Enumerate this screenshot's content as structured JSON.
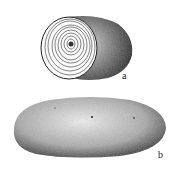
{
  "figure": {
    "panels": [
      {
        "id": "a",
        "label": "a",
        "description": "cut specimen showing concentric growth rings"
      },
      {
        "id": "b",
        "label": "b",
        "description": "whole elongated ovoid specimen, stippled"
      }
    ],
    "colors": {
      "ink": "#1a1a1a",
      "paper": "#ffffff"
    }
  }
}
